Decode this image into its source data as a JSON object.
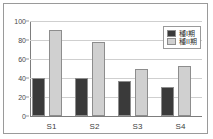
{
  "chart_data": {
    "type": "bar",
    "title": "",
    "subtitle": "",
    "xlabel": "",
    "ylabel": "",
    "categories": [
      "S1",
      "S2",
      "S3",
      "S4"
    ],
    "series": [
      {
        "name": "種I期",
        "values": [
          40,
          40,
          37,
          31
        ],
        "color": "#3a3a3a"
      },
      {
        "name": "種II期",
        "values": [
          91,
          78,
          49,
          53
        ],
        "color": "#d0d0d0"
      }
    ],
    "ylim": [
      0,
      100
    ],
    "yticks": [
      0,
      20,
      40,
      60,
      80,
      100
    ],
    "ytick_labels": [
      "0",
      "20",
      "40",
      "60",
      "80",
      "100"
    ],
    "grid": true,
    "grid_axis": "y",
    "legend_position": "top-right",
    "legend_visible": true,
    "bar_group_count": 4,
    "series_count": 2
  },
  "colors": {
    "series_1": "#3a3a3a",
    "series_2": "#d0d0d0",
    "gridline": "#cfcfcf",
    "axis": "#7d7d7d",
    "frame_border": "#9a9a9a",
    "bar_outline": "#8d8d8d",
    "tick_text": "#4a4a4a",
    "category_text": "#3d3d3d",
    "legend_text": "#2e2e2e",
    "background": "#ffffff"
  }
}
